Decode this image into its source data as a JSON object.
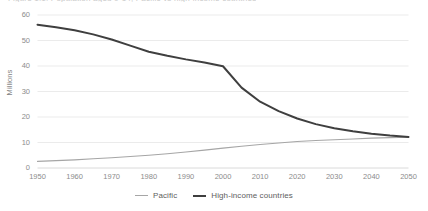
{
  "clipped_header": "Figure 1.1: Population aged 0-14, Pacific vs high-income countries",
  "legend": {
    "position": "bottom-center",
    "items": [
      {
        "label": "Pacific",
        "color": "#a6a6a6",
        "width": 1.1
      },
      {
        "label": "High-income countries",
        "color": "#3f3f3f",
        "width": 2.0
      }
    ]
  },
  "chart_data": {
    "type": "line",
    "title": "",
    "xlabel": "",
    "ylabel": "Millions",
    "xlim": [
      1950,
      2050
    ],
    "ylim": [
      0,
      60
    ],
    "ytick_labels": [
      "0",
      "10",
      "20",
      "30",
      "40",
      "50",
      "60"
    ],
    "yticks": [
      0,
      10,
      20,
      30,
      40,
      50,
      60
    ],
    "xtick_labels": [
      "1950",
      "1960",
      "1970",
      "1980",
      "1990",
      "2000",
      "2010",
      "2020",
      "2030",
      "2040",
      "2050"
    ],
    "xticks": [
      1950,
      1960,
      1970,
      1980,
      1990,
      2000,
      2010,
      2020,
      2030,
      2040,
      2050
    ],
    "grid": "horizontal",
    "x": [
      1950,
      1955,
      1960,
      1965,
      1970,
      1975,
      1980,
      1985,
      1990,
      1995,
      2000,
      2005,
      2010,
      2015,
      2020,
      2025,
      2030,
      2035,
      2040,
      2045,
      2050
    ],
    "series": [
      {
        "name": "Pacific",
        "color": "#a6a6a6",
        "width": 1.1,
        "values": [
          2.6,
          2.9,
          3.2,
          3.6,
          4.0,
          4.5,
          5.0,
          5.6,
          6.3,
          7.0,
          7.8,
          8.5,
          9.2,
          9.8,
          10.4,
          10.8,
          11.1,
          11.4,
          11.7,
          11.9,
          12.1
        ]
      },
      {
        "name": "High-income countries",
        "color": "#3f3f3f",
        "width": 2.0,
        "values": [
          56.2,
          55.2,
          54.0,
          52.4,
          50.4,
          48.0,
          45.6,
          44.0,
          42.6,
          41.4,
          39.9,
          31.5,
          26.0,
          22.3,
          19.4,
          17.2,
          15.6,
          14.4,
          13.4,
          12.7,
          12.2
        ]
      }
    ]
  }
}
